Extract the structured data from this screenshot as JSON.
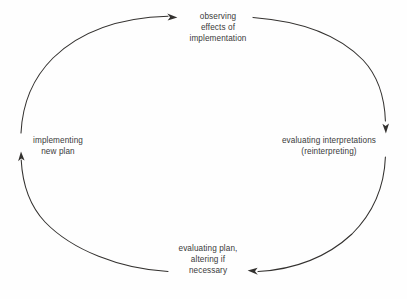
{
  "diagram": {
    "type": "cycle",
    "title": "",
    "shape": "ellipse",
    "direction": "clockwise",
    "stroke_color": "#33312f",
    "text_color": "#3a3a3a",
    "background_color": "#fefefe",
    "nodes": [
      {
        "id": "observing",
        "position": "top",
        "lines": [
          "observing",
          "effects of",
          "implementation"
        ]
      },
      {
        "id": "evaluating-interpretations",
        "position": "right",
        "lines": [
          "evaluating interpretations",
          "(reinterpreting)"
        ]
      },
      {
        "id": "evaluating-plan",
        "position": "bottom",
        "lines": [
          "evaluating plan,",
          "altering if",
          "necessary"
        ]
      },
      {
        "id": "implementing",
        "position": "left",
        "lines": [
          "implementing",
          "new plan"
        ]
      }
    ],
    "arrows": [
      {
        "id": "arrow-to-observing",
        "direction": "right",
        "at": "top-left-arc-end"
      },
      {
        "id": "arrow-to-evaluating-interpretations",
        "direction": "down",
        "at": "top-right-arc-end"
      },
      {
        "id": "arrow-to-evaluating-plan",
        "direction": "left",
        "at": "bottom-right-arc-end"
      },
      {
        "id": "arrow-to-implementing",
        "direction": "up",
        "at": "bottom-left-arc-end"
      }
    ]
  }
}
